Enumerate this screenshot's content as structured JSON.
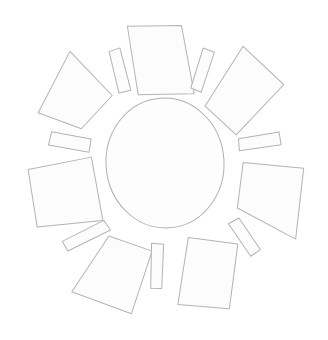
{
  "figure": {
    "background_color": "#ffffff",
    "stroke_color": "#b3b3b3",
    "fill_color": "#fcfcfc",
    "core_fill_color": "#fdfdfd",
    "core_stroke_color": "#aeaeae",
    "stroke_width": "1",
    "width": "328",
    "height": "340",
    "rotation_degrees": "-4"
  },
  "core": {
    "label": "center-disc",
    "center_x": "165",
    "center_y": "163",
    "radius_x": "59",
    "radius_y": "65"
  },
  "petals": [
    {
      "label": "petal-top",
      "index": "1",
      "angle_degrees": "-86",
      "points": "137,24 191,27 199,96 143,93"
    },
    {
      "label": "petal-upper-right",
      "index": "2",
      "angle_degrees": "-26",
      "points": "251,52 289,93 238,140 209,109"
    },
    {
      "label": "petal-lower-right",
      "index": "3",
      "angle_degrees": "34",
      "points": "243,168 303,178 290,248 234,213"
    },
    {
      "label": "petal-bottom",
      "index": "4",
      "angle_degrees": "94",
      "points": "183,239 232,249 219,313 168,305"
    },
    {
      "label": "petal-lower-left",
      "index": "5",
      "angle_degrees": "154",
      "points": "104,232 146,250 121,311 63,285"
    },
    {
      "label": "petal-left",
      "index": "6",
      "angle_degrees": "-154",
      "points": "92,152 99,216 33,218 28,160"
    },
    {
      "label": "petal-upper-left",
      "index": "7",
      "angle_degrees": "-146",
      "points": "78,45 117,92 84,123 42,104"
    }
  ],
  "rays": [
    {
      "label": "ray-top-left",
      "index": "1",
      "angle_degrees": "-110",
      "points": "117,48 128,45 136,88 124,90"
    },
    {
      "label": "ray-top-right",
      "index": "2",
      "angle_degrees": "-58",
      "points": "211,51 222,56 206,95 196,90"
    },
    {
      "label": "ray-right-upper",
      "index": "3",
      "angle_degrees": "-6",
      "points": "240,144 281,140 282,153 240,156"
    },
    {
      "label": "ray-right-lower",
      "index": "4",
      "angle_degrees": "62",
      "points": "224,228 235,223 254,256 244,262"
    },
    {
      "label": "ray-bottom",
      "index": "5",
      "angle_degrees": "118",
      "points": "146,242 158,244 153,288 142,287"
    },
    {
      "label": "ray-bottom-left",
      "index": "6",
      "angle_degrees": "174",
      "points": "100,216 106,226 62,244 57,234"
    },
    {
      "label": "ray-left-upper",
      "index": "7",
      "angle_degrees": "-174",
      "points": "54,124 93,134 90,147 50,137"
    }
  ]
}
